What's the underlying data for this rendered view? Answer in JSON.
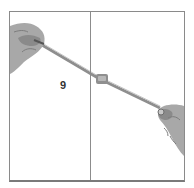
{
  "illustration": {
    "step_number": "9",
    "colors": {
      "frame": "#8a8a8a",
      "hand": "#a8a8a8",
      "hand_shadow": "#7d7d7d",
      "string": "#9a9a9a",
      "knot": "#8f8f8f"
    }
  }
}
